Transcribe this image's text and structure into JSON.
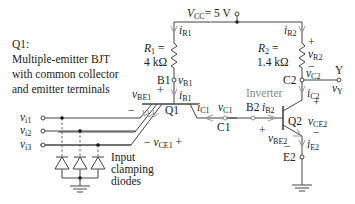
{
  "description": {
    "line1": "Q1:",
    "line2": "Multiple-emitter BJT",
    "line3": "with common collector",
    "line4": "and emitter terminals"
  },
  "supply": {
    "label": "V",
    "sub": "CC",
    "value": "= 5 V"
  },
  "r1": {
    "name": "R",
    "sub": "1",
    "eq": " =",
    "value": "4 kΩ",
    "current": "i",
    "current_sub": "R1"
  },
  "r2": {
    "name": "R",
    "sub": "2",
    "eq": " =",
    "value": "1.4 kΩ",
    "current": "i",
    "current_sub": "R2",
    "voltage": "v",
    "voltage_sub": "R2",
    "plus": "+",
    "minus": "−"
  },
  "nodes": {
    "b1": "B1",
    "vb1": "v",
    "vb1_sub": "B1",
    "ib1": "i",
    "ib1_sub": "B1",
    "c1": "C1",
    "vc1": "v",
    "vc1_sub": "C1",
    "ic1": "i",
    "ic1_sub": "C1",
    "b2": "B2",
    "ib2": "i",
    "ib2_sub": "B2",
    "c2": "C2",
    "vc2": "v",
    "vc2_sub": "C2",
    "ic2": "i",
    "ic2_sub": "C2",
    "e2": "E2",
    "ie2": "i",
    "ie2_sub": "E2",
    "y": "Y",
    "vy": "v",
    "vy_sub": "Y"
  },
  "transistors": {
    "q1": "Q1",
    "q2": "Q2",
    "vbe1": "v",
    "vbe1_sub": "BE1",
    "vce1": "v",
    "vce1_sub": "CE1",
    "vbe2": "v",
    "vbe2_sub": "BE2",
    "vce2": "v",
    "vce2_sub": "CE2",
    "plus": "+",
    "minus": "−"
  },
  "inputs": [
    {
      "label": "v",
      "sub": "i1"
    },
    {
      "label": "v",
      "sub": "i2"
    },
    {
      "label": "v",
      "sub": "i3"
    }
  ],
  "inverter_label": "Inverter",
  "clamp_label": {
    "line1": "Input",
    "line2": "clamping",
    "line3": "diodes"
  }
}
